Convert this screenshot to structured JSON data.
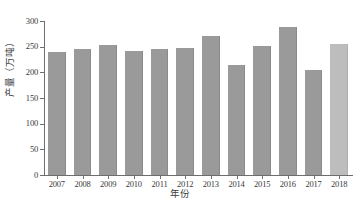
{
  "chart_data": {
    "type": "bar",
    "title": "",
    "subtitle": "",
    "xlabel": "年份",
    "ylabel": "产量（万吨）",
    "categories": [
      "2007",
      "2008",
      "2009",
      "2010",
      "2011",
      "2012",
      "2013",
      "2014",
      "2015",
      "2016",
      "2017",
      "2018"
    ],
    "values": [
      240,
      246,
      253,
      242,
      245,
      248,
      270,
      214,
      251,
      289,
      205,
      256
    ],
    "ylim": [
      0,
      300
    ],
    "ytick_labels": [
      "0",
      "50",
      "100",
      "150",
      "200",
      "250",
      "300"
    ],
    "ytick_values": [
      0,
      50,
      100,
      150,
      200,
      250,
      300
    ],
    "xtick_labels": [
      "2007",
      "2008",
      "2009",
      "2010",
      "2011",
      "2012",
      "2013",
      "2014",
      "2015",
      "2016",
      "2017",
      "2018"
    ],
    "grid": false,
    "legend": null,
    "legend_position": "none",
    "annotations": [],
    "series": [
      {
        "name": "产量",
        "values": [
          240,
          246,
          253,
          242,
          245,
          248,
          270,
          214,
          251,
          289,
          205,
          256
        ]
      }
    ],
    "bar_colors": [
      "#9a9a9a",
      "#9a9a9a",
      "#9a9a9a",
      "#9a9a9a",
      "#9a9a9a",
      "#9a9a9a",
      "#9a9a9a",
      "#9a9a9a",
      "#9a9a9a",
      "#9a9a9a",
      "#9a9a9a",
      "#bdbdbd"
    ],
    "highlight_index": 11,
    "colors": {
      "bar_default": "#9a9a9a",
      "bar_highlight": "#bdbdbd",
      "axis": "#6e6e6e",
      "text": "#3a3a3a",
      "background": "#ffffff"
    }
  }
}
